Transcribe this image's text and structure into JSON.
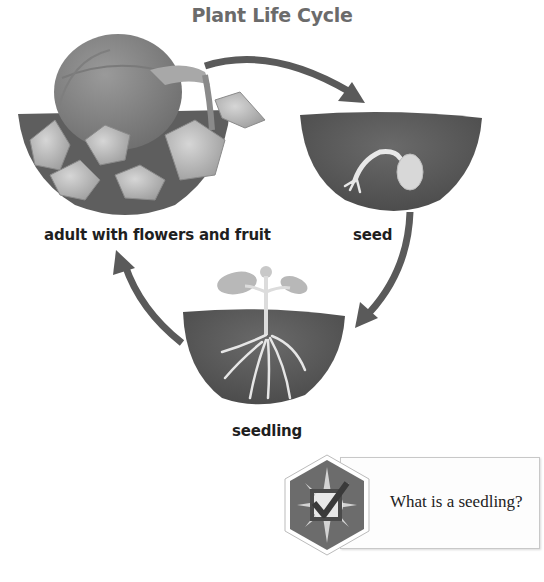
{
  "diagram": {
    "title": "Plant Life Cycle",
    "stages": [
      {
        "id": "adult",
        "label": "adult with flowers and fruit",
        "illustration": "pumpkin-plant-in-soil"
      },
      {
        "id": "seed",
        "label": "seed",
        "illustration": "sprouting-seed-in-soil"
      },
      {
        "id": "seedling",
        "label": "seedling",
        "illustration": "seedling-with-roots-in-soil"
      }
    ],
    "arrows": [
      {
        "from": "adult",
        "to": "seed"
      },
      {
        "from": "seed",
        "to": "seedling"
      },
      {
        "from": "seedling",
        "to": "adult"
      }
    ],
    "colors": {
      "arrow": "#5a5a5a",
      "soil": "#5c5c5c",
      "title": "#6b6b6b",
      "label": "#1f1f1f"
    }
  },
  "question": {
    "icon": "checkbox-check-badge-icon",
    "text": "What is a seedling?"
  }
}
